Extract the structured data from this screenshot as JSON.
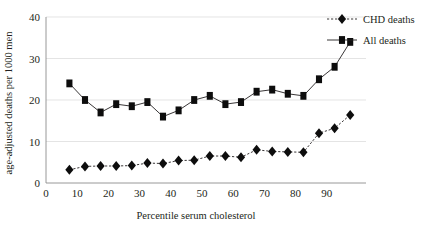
{
  "chart_data": {
    "type": "line",
    "title": "",
    "xlabel": "Percentile serum cholesterol",
    "ylabel": "age-adjusted deaths per 1000 men",
    "xlim": [
      0,
      100
    ],
    "ylim": [
      0,
      40
    ],
    "xticks": [
      0,
      10,
      20,
      30,
      40,
      50,
      60,
      70,
      80,
      90
    ],
    "yticks": [
      0,
      10,
      20,
      30,
      40
    ],
    "grid": "horizontal",
    "legend_position": "top-right",
    "x": [
      7.5,
      12.5,
      17.5,
      22.5,
      27.5,
      32.5,
      37.5,
      42.5,
      47.5,
      52.5,
      57.5,
      62.5,
      67.5,
      72.5,
      77.5,
      82.5,
      87.5,
      92.5,
      97.5
    ],
    "series": [
      {
        "name": "CHD deaths",
        "marker": "diamond",
        "line_style": "dashed",
        "color": "#0d0d0d",
        "values": [
          3.2,
          4.0,
          4.1,
          4.1,
          4.2,
          4.8,
          4.7,
          5.4,
          5.5,
          6.5,
          6.5,
          6.2,
          8.0,
          7.6,
          7.5,
          7.4,
          12.0,
          13.2,
          16.4
        ]
      },
      {
        "name": "All deaths",
        "marker": "square",
        "line_style": "solid",
        "color": "#0d0d0d",
        "values": [
          24.0,
          20.0,
          17.0,
          19.0,
          18.5,
          19.5,
          16.0,
          17.5,
          20.0,
          21.0,
          19.0,
          19.5,
          22.0,
          22.5,
          21.5,
          21.0,
          25.0,
          28.0,
          34.0
        ]
      }
    ]
  },
  "axes": {
    "x_title": "Percentile serum cholesterol",
    "y_title": "age-adjusted deaths per 1000 men",
    "x_tick_labels": [
      "0",
      "10",
      "20",
      "30",
      "40",
      "50",
      "60",
      "70",
      "80",
      "90"
    ],
    "y_tick_labels": [
      "0",
      "10",
      "20",
      "30",
      "40"
    ]
  },
  "legend": {
    "entries": [
      {
        "label": "CHD deaths",
        "marker": "diamond-marker",
        "style": "dashed"
      },
      {
        "label": "All deaths",
        "marker": "square-marker",
        "style": "solid"
      }
    ]
  },
  "colors": {
    "ink": "#231f20",
    "marker": "#0d0d0d",
    "grid": "#d9d9d9",
    "axis": "#8c8c8c",
    "background": "#ffffff"
  }
}
